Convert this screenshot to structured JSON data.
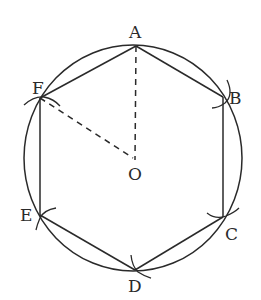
{
  "diagram": {
    "title": "",
    "colors": {
      "stroke": "#2a2a2a",
      "background": "#ffffff"
    },
    "circle": {
      "center_label": "O",
      "cx": 133,
      "cy": 158,
      "rx": 109,
      "ry": 113
    },
    "points": [
      {
        "label": "A",
        "x": 136,
        "y": 46,
        "label_x": 129,
        "label_y": 38
      },
      {
        "label": "B",
        "x": 223,
        "y": 97,
        "label_x": 229,
        "label_y": 104
      },
      {
        "label": "C",
        "x": 223,
        "y": 217,
        "label_x": 225,
        "label_y": 240
      },
      {
        "label": "D",
        "x": 135,
        "y": 270,
        "label_x": 128,
        "label_y": 292
      },
      {
        "label": "E",
        "x": 40,
        "y": 215,
        "label_x": 20,
        "label_y": 221
      },
      {
        "label": "F",
        "x": 40,
        "y": 98,
        "label_x": 32,
        "label_y": 94
      },
      {
        "label": "O",
        "x": 135,
        "y": 158,
        "label_x": 128,
        "label_y": 180
      }
    ],
    "labels": {
      "A": "A",
      "B": "B",
      "C": "C",
      "D": "D",
      "E": "E",
      "F": "F",
      "O": "O"
    },
    "edges": [
      "AB",
      "BC",
      "CD",
      "DE",
      "EF",
      "FA"
    ],
    "dashed_segments": [
      "AO",
      "FO"
    ]
  }
}
